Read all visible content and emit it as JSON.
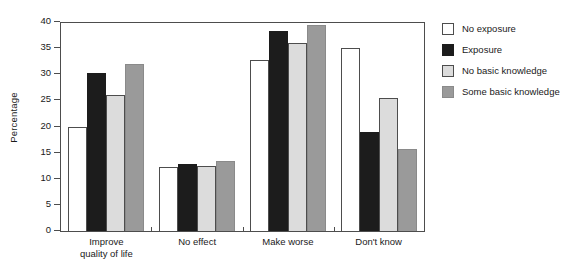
{
  "chart_data": {
    "type": "bar",
    "title": "",
    "subtitle": "",
    "xlabel": "",
    "ylabel": "Percentage",
    "ylim": [
      0,
      40
    ],
    "yticks": [
      0,
      5,
      10,
      15,
      20,
      25,
      30,
      35,
      40
    ],
    "ytick_labels": [
      "0",
      "5",
      "10",
      "15",
      "20",
      "25",
      "30",
      "35",
      "40"
    ],
    "grid": false,
    "legend_position": "right",
    "categories": [
      "Improve\nquality of life",
      "No effect",
      "Make worse",
      "Don't know"
    ],
    "series": [
      {
        "name": "No exposure",
        "color": "#ffffff",
        "edge_color": "#4d4d4d",
        "values": [
          19.9,
          12.3,
          32.7,
          35.1
        ]
      },
      {
        "name": "Exposure",
        "color": "#1c1c1c",
        "edge_color": "#1c1c1c",
        "values": [
          30.2,
          12.9,
          38.2,
          18.9
        ]
      },
      {
        "name": "No basic knowledge",
        "color": "#dcdcdc",
        "edge_color": "#4d4d4d",
        "values": [
          26.1,
          12.4,
          35.9,
          25.5
        ]
      },
      {
        "name": "Some basic knowledge",
        "color": "#9a9a9a",
        "edge_color": "#8a8a8a",
        "values": [
          32.0,
          13.4,
          39.4,
          15.7
        ]
      }
    ]
  }
}
